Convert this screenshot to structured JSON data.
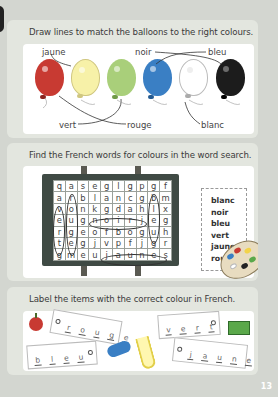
{
  "page_number": "13",
  "section1": {
    "instruction": "Draw lines to match the balloons to the right colours.",
    "balloons": [
      {
        "name": "red-balloon",
        "color": "#c83a32"
      },
      {
        "name": "yellow-balloon",
        "color": "#f7f1a8"
      },
      {
        "name": "green-balloon",
        "color": "#a9cf7a"
      },
      {
        "name": "blue-balloon",
        "color": "#3a7fc4"
      },
      {
        "name": "white-balloon",
        "color": "#ffffff"
      },
      {
        "name": "black-balloon",
        "color": "#1c1c1c"
      }
    ],
    "labels": {
      "jaune": "jaune",
      "noir": "noir",
      "bleu": "bleu",
      "vert": "vert",
      "rouge": "rouge",
      "blanc": "blanc"
    }
  },
  "section2": {
    "instruction": "Find the French words for colours in the word search.",
    "grid": [
      [
        "q",
        "a",
        "s",
        "e",
        "g",
        "l",
        "g",
        "p",
        "g",
        "f"
      ],
      [
        "a",
        "r",
        "b",
        "l",
        "a",
        "n",
        "c",
        "g",
        "b",
        "m"
      ],
      [
        "v",
        "o",
        "n",
        "k",
        "g",
        "d",
        "a",
        "h",
        "l",
        "x"
      ],
      [
        "e",
        "u",
        "g",
        "n",
        "o",
        "i",
        "r",
        "j",
        "e",
        "g"
      ],
      [
        "r",
        "g",
        "e",
        "o",
        "f",
        "b",
        "o",
        "g",
        "u",
        "h"
      ],
      [
        "t",
        "e",
        "g",
        "j",
        "v",
        "p",
        "f",
        "j",
        "g",
        "r"
      ],
      [
        "g",
        "m",
        "e",
        "u",
        "j",
        "a",
        "u",
        "n",
        "e",
        "s"
      ]
    ],
    "word_list": [
      "blanc",
      "noir",
      "bleu",
      "vert",
      "jaune",
      "rouge"
    ]
  },
  "section3": {
    "instruction": "Label the items with the correct colour in French.",
    "items": [
      {
        "item": "apple",
        "answer": [
          "r",
          "o",
          "u",
          "g",
          "e"
        ]
      },
      {
        "item": "present",
        "answer": [
          "v",
          "e",
          "r",
          "t"
        ]
      },
      {
        "item": "plane",
        "answer": [
          "b",
          "l",
          "e",
          "u"
        ]
      },
      {
        "item": "banana",
        "answer": [
          "j",
          "a",
          "u",
          "n",
          "e"
        ]
      }
    ]
  }
}
